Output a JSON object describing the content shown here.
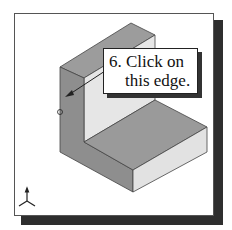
{
  "callout": {
    "line1": "6. Click on",
    "line2": "this edge."
  },
  "icons": {
    "triad": "xyz-axis-triad-icon",
    "pick": "edge-pick-circle-icon",
    "arrow": "pointer-arrow-icon"
  },
  "colors": {
    "shadow": "#2e2e2e",
    "face_top": "#9a9a9a",
    "face_left": "#8c8c8c",
    "face_light": "#e4e4e4",
    "outline": "#333333"
  }
}
